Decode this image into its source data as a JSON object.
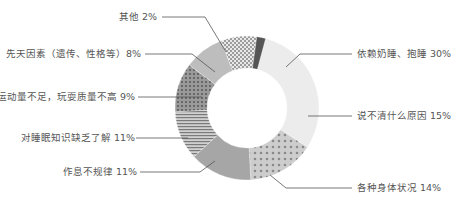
{
  "chart_data": {
    "type": "pie",
    "subtype": "donut",
    "title": "",
    "center": [
      247,
      108
    ],
    "outer_radius": 72,
    "inner_radius": 40,
    "slices": [
      {
        "label": "依赖奶睡、抱睡",
        "value": 30,
        "text": "依赖奶睡、抱睡 30%",
        "fill": "#ececec",
        "pattern": "solid"
      },
      {
        "label": "说不清什么原因",
        "value": 15,
        "text": "说不清什么原因 15%",
        "fill": "#c9c9c9",
        "pattern": "circles"
      },
      {
        "label": "各种身体状况",
        "value": 14,
        "text": "各种身体状况 14%",
        "fill": "#a6a6a6",
        "pattern": "solid"
      },
      {
        "label": "作息不规律",
        "value": 11,
        "text": "作息不规律 11%",
        "fill": "#b0b0b0",
        "pattern": "hlines"
      },
      {
        "label": "对睡眠知识缺乏了解",
        "value": 11,
        "text": "对睡眠知识缺乏了解 11%",
        "fill": "#8f8f8f",
        "pattern": "dots"
      },
      {
        "label": "运动量不足，玩耍质量不高",
        "value": 9,
        "text": "运动量不足，玩耍质量不高 9%",
        "fill": "#bdbdbd",
        "pattern": "solid"
      },
      {
        "label": "先天因素（遗传、性格等）",
        "value": 8,
        "text": "先天因素（遗传、性格等）8%",
        "fill": "#d9d9d9",
        "pattern": "checker"
      },
      {
        "label": "其他",
        "value": 2,
        "text": "其他 2%",
        "fill": "#555555",
        "pattern": "solid"
      }
    ],
    "legend": "none (leader-line labels)"
  },
  "labels": {
    "other": "其他 2%",
    "innate": "先天因素（遗传、性格等）8%",
    "exercise": "运动量不足，玩耍质量不高 9%",
    "knowledge": "对睡眠知识缺乏了解 11%",
    "schedule": "作息不规律 11%",
    "depend": "依赖奶睡、抱睡 30%",
    "unknown": "说不清什么原因 15%",
    "health": "各种身体状况 14%"
  }
}
